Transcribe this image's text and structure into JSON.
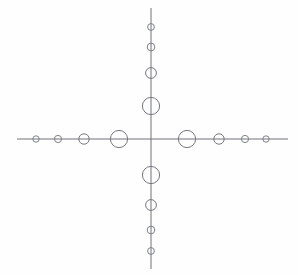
{
  "figure": {
    "description": "Two perpendicular straight lines crossing at a center point, with open circles of graduated size placed along each arm; circles are largest nearest the crossing point and shrink toward the line ends.",
    "background_color": "#fefefe",
    "line_color": "#6e7278",
    "circle_stroke_color": "#74787e",
    "circle_fill": "none",
    "line_width": 1,
    "canvas": {
      "width": 298,
      "height": 275
    },
    "center": {
      "x": 151,
      "y": 139
    }
  },
  "chart_data": {
    "type": "scatter",
    "subtitle": "",
    "xlabel": "",
    "ylabel": "",
    "xlim": [
      0,
      298
    ],
    "ylim": [
      0,
      275
    ],
    "grid": false,
    "legend": "none",
    "axes": [
      {
        "name": "horizontal-axis",
        "orientation": "horizontal",
        "x1": 17,
        "y1": 139,
        "x2": 288,
        "y2": 139
      },
      {
        "name": "vertical-axis",
        "orientation": "vertical",
        "x1": 151,
        "y1": 8,
        "x2": 151,
        "y2": 269
      }
    ],
    "series": [
      {
        "name": "horizontal-left-nodes",
        "arm": "left",
        "points": [
          {
            "id": "L4",
            "x": 36,
            "y": 139,
            "r": 3.2
          },
          {
            "id": "L3",
            "x": 58,
            "y": 139,
            "r": 3.6
          },
          {
            "id": "L2",
            "x": 84,
            "y": 139,
            "r": 5.2
          },
          {
            "id": "L1",
            "x": 119,
            "y": 139,
            "r": 8.6
          }
        ]
      },
      {
        "name": "horizontal-right-nodes",
        "arm": "right",
        "points": [
          {
            "id": "R1",
            "x": 187,
            "y": 139,
            "r": 8.6
          },
          {
            "id": "R2",
            "x": 219,
            "y": 139,
            "r": 5.2
          },
          {
            "id": "R3",
            "x": 245,
            "y": 139,
            "r": 3.6
          },
          {
            "id": "R4",
            "x": 266,
            "y": 139,
            "r": 3.2
          }
        ]
      },
      {
        "name": "vertical-top-nodes",
        "arm": "top",
        "points": [
          {
            "id": "T4",
            "x": 151,
            "y": 27,
            "r": 3.4
          },
          {
            "id": "T3",
            "x": 151,
            "y": 47,
            "r": 3.8
          },
          {
            "id": "T2",
            "x": 151,
            "y": 73,
            "r": 5.4
          },
          {
            "id": "T1",
            "x": 151,
            "y": 106,
            "r": 8.6
          }
        ]
      },
      {
        "name": "vertical-bottom-nodes",
        "arm": "bottom",
        "points": [
          {
            "id": "B1",
            "x": 151,
            "y": 175,
            "r": 8.6
          },
          {
            "id": "B2",
            "x": 151,
            "y": 205,
            "r": 5.4
          },
          {
            "id": "B3",
            "x": 151,
            "y": 230,
            "r": 3.8
          },
          {
            "id": "B4",
            "x": 151,
            "y": 251,
            "r": 3.4
          }
        ]
      }
    ],
    "total_nodes": 16
  }
}
